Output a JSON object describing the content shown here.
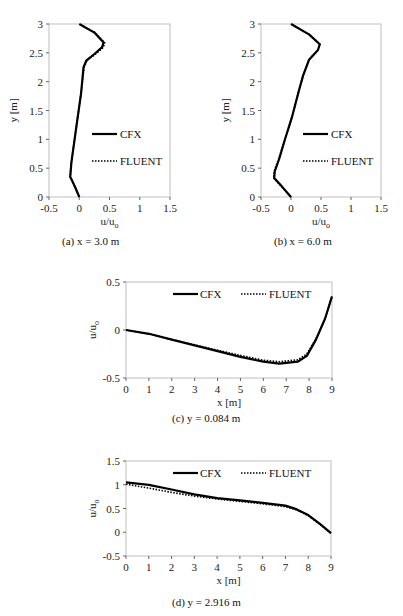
{
  "figure": {
    "captions": {
      "a": "(a)  x = 3.0 m",
      "b": "(b)  x = 6.0 m",
      "c": "(c)  y = 0.084 m",
      "d": "(d)  y = 2.916 m"
    },
    "legend": {
      "cfx": "CFX",
      "fluent": "FLUENT"
    },
    "line_color": "#000000",
    "frame_color": "#bfbfbf"
  },
  "chart_data": [
    {
      "id": "a",
      "type": "line",
      "title": "(a) x = 3.0 m",
      "xlabel": "u/u_o",
      "ylabel": "y [m]",
      "xlim": [
        -0.5,
        1.5
      ],
      "ylim": [
        0,
        3
      ],
      "xticks": [
        "-0.5",
        "0",
        "0.5",
        "1",
        "1.5"
      ],
      "yticks": [
        "0",
        "0.5",
        "1",
        "1.5",
        "2",
        "2.5",
        "3"
      ],
      "legend_position": "right-middle",
      "series": [
        {
          "name": "CFX",
          "style": "solid",
          "points": [
            [
              0.0,
              0.0
            ],
            [
              -0.08,
              0.2
            ],
            [
              -0.15,
              0.35
            ],
            [
              -0.13,
              0.6
            ],
            [
              -0.05,
              1.2
            ],
            [
              0.03,
              1.8
            ],
            [
              0.07,
              2.25
            ],
            [
              0.12,
              2.37
            ],
            [
              0.25,
              2.48
            ],
            [
              0.38,
              2.6
            ],
            [
              0.4,
              2.68
            ],
            [
              0.25,
              2.85
            ],
            [
              0.0,
              3.0
            ]
          ]
        },
        {
          "name": "FLUENT",
          "style": "dotted",
          "points": [
            [
              0.0,
              0.0
            ],
            [
              -0.08,
              0.2
            ],
            [
              -0.15,
              0.35
            ],
            [
              -0.13,
              0.6
            ],
            [
              -0.05,
              1.2
            ],
            [
              0.03,
              1.8
            ],
            [
              0.08,
              2.25
            ],
            [
              0.13,
              2.37
            ],
            [
              0.27,
              2.48
            ],
            [
              0.4,
              2.6
            ],
            [
              0.42,
              2.68
            ],
            [
              0.26,
              2.85
            ],
            [
              0.0,
              3.0
            ]
          ]
        }
      ]
    },
    {
      "id": "b",
      "type": "line",
      "title": "(b) x = 6.0 m",
      "xlabel": "u/u_o",
      "ylabel": "y [m]",
      "xlim": [
        -0.5,
        1.5
      ],
      "ylim": [
        0,
        3
      ],
      "xticks": [
        "-0.5",
        "0",
        "0.5",
        "1",
        "1.5"
      ],
      "yticks": [
        "0",
        "0.5",
        "1",
        "1.5",
        "2",
        "2.5",
        "3"
      ],
      "legend_position": "right-middle",
      "series": [
        {
          "name": "CFX",
          "style": "solid",
          "points": [
            [
              0.0,
              0.0
            ],
            [
              -0.15,
              0.18
            ],
            [
              -0.28,
              0.33
            ],
            [
              -0.27,
              0.45
            ],
            [
              -0.2,
              0.65
            ],
            [
              -0.1,
              1.0
            ],
            [
              0.02,
              1.4
            ],
            [
              0.12,
              1.8
            ],
            [
              0.2,
              2.1
            ],
            [
              0.3,
              2.38
            ],
            [
              0.45,
              2.55
            ],
            [
              0.48,
              2.65
            ],
            [
              0.3,
              2.82
            ],
            [
              0.0,
              3.0
            ]
          ]
        },
        {
          "name": "FLUENT",
          "style": "dotted",
          "points": [
            [
              0.0,
              0.0
            ],
            [
              -0.16,
              0.18
            ],
            [
              -0.29,
              0.33
            ],
            [
              -0.28,
              0.45
            ],
            [
              -0.21,
              0.65
            ],
            [
              -0.1,
              1.0
            ],
            [
              0.02,
              1.4
            ],
            [
              0.12,
              1.8
            ],
            [
              0.2,
              2.1
            ],
            [
              0.3,
              2.38
            ],
            [
              0.45,
              2.55
            ],
            [
              0.48,
              2.65
            ],
            [
              0.3,
              2.82
            ],
            [
              0.0,
              3.0
            ]
          ]
        }
      ]
    },
    {
      "id": "c",
      "type": "line",
      "title": "(c) y = 0.084 m",
      "xlabel": "x [m]",
      "ylabel": "u/u_o",
      "xlim": [
        0,
        9
      ],
      "ylim": [
        -0.5,
        0.5
      ],
      "xticks": [
        "0",
        "1",
        "2",
        "3",
        "4",
        "5",
        "6",
        "7",
        "8",
        "9"
      ],
      "yticks": [
        "-0.5",
        "0",
        "0.5"
      ],
      "legend_position": "top",
      "series": [
        {
          "name": "CFX",
          "style": "solid",
          "points": [
            [
              0,
              0.0
            ],
            [
              1,
              -0.04
            ],
            [
              2,
              -0.1
            ],
            [
              3,
              -0.16
            ],
            [
              4,
              -0.22
            ],
            [
              5,
              -0.28
            ],
            [
              6,
              -0.33
            ],
            [
              6.7,
              -0.35
            ],
            [
              7.5,
              -0.33
            ],
            [
              7.9,
              -0.27
            ],
            [
              8.3,
              -0.1
            ],
            [
              8.7,
              0.12
            ],
            [
              9,
              0.35
            ]
          ]
        },
        {
          "name": "FLUENT",
          "style": "dotted",
          "points": [
            [
              0,
              0.0
            ],
            [
              1,
              -0.04
            ],
            [
              2,
              -0.1
            ],
            [
              3,
              -0.155
            ],
            [
              4,
              -0.21
            ],
            [
              5,
              -0.265
            ],
            [
              6,
              -0.315
            ],
            [
              6.7,
              -0.33
            ],
            [
              7.5,
              -0.31
            ],
            [
              7.9,
              -0.25
            ],
            [
              8.3,
              -0.09
            ],
            [
              8.7,
              0.12
            ],
            [
              9,
              0.35
            ]
          ]
        }
      ]
    },
    {
      "id": "d",
      "type": "line",
      "title": "(d) y = 2.916 m",
      "xlabel": "x [m]",
      "ylabel": "u/u_o",
      "xlim": [
        0,
        9
      ],
      "ylim": [
        -0.5,
        1.5
      ],
      "xticks": [
        "0",
        "1",
        "2",
        "3",
        "4",
        "5",
        "6",
        "7",
        "8",
        "9"
      ],
      "yticks": [
        "-0.5",
        "0",
        "0.5",
        "1",
        "1.5"
      ],
      "legend_position": "top",
      "series": [
        {
          "name": "CFX",
          "style": "solid",
          "points": [
            [
              0,
              1.05
            ],
            [
              1,
              1.0
            ],
            [
              2,
              0.9
            ],
            [
              3,
              0.8
            ],
            [
              4,
              0.72
            ],
            [
              5,
              0.67
            ],
            [
              6,
              0.62
            ],
            [
              7,
              0.56
            ],
            [
              7.5,
              0.48
            ],
            [
              8,
              0.36
            ],
            [
              8.5,
              0.18
            ],
            [
              9,
              -0.02
            ]
          ]
        },
        {
          "name": "FLUENT",
          "style": "dotted",
          "points": [
            [
              0,
              1.01
            ],
            [
              1,
              0.93
            ],
            [
              2,
              0.84
            ],
            [
              3,
              0.76
            ],
            [
              4,
              0.7
            ],
            [
              5,
              0.65
            ],
            [
              6,
              0.6
            ],
            [
              7,
              0.54
            ],
            [
              7.5,
              0.47
            ],
            [
              8,
              0.35
            ],
            [
              8.5,
              0.17
            ],
            [
              9,
              -0.02
            ]
          ]
        }
      ]
    }
  ]
}
